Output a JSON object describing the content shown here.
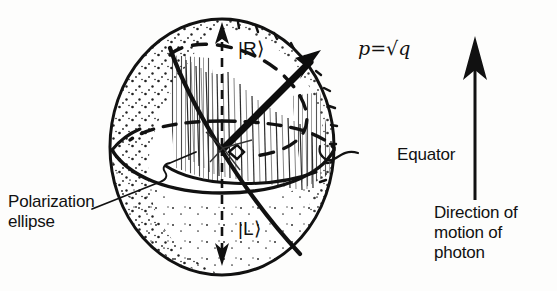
{
  "figure": {
    "type": "scientific-diagram",
    "background_color": "#fdfdfc",
    "ink_color": "#111111"
  },
  "labels": {
    "pole_top": "|R⟩",
    "pole_bottom": "|L⟩",
    "amplitude": "p=√q",
    "equator": "Equator",
    "polarization_ellipse_line1": "Polarization",
    "polarization_ellipse_line2": "ellipse",
    "direction_line1": "Direction of",
    "direction_line2": "motion of",
    "direction_line3": "photon"
  },
  "geometry": {
    "sphere_center_x": 222,
    "sphere_center_y": 147,
    "sphere_radius_x": 112,
    "sphere_radius_y": 128,
    "equator_ry": 26,
    "state_arrow_angle_deg": 40
  },
  "icons": {
    "up_axis_arrow": "arrow-up-icon",
    "down_axis_arrow": "arrow-down-icon",
    "state_vector_arrow": "arrow-vector-icon",
    "motion_arrow": "arrow-up-long-icon"
  }
}
